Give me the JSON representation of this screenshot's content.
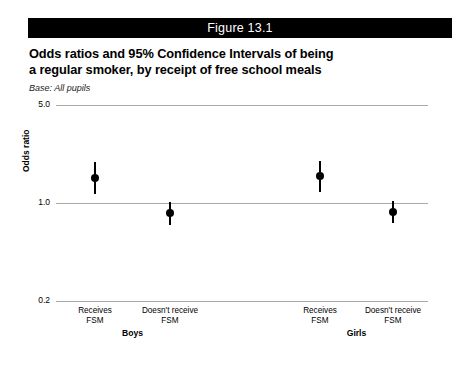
{
  "figure": {
    "bar_label": "Figure 13.1",
    "title_lines": [
      "Odds ratios and 95% Confidence Intervals of being",
      "a regular smoker, by receipt of free school meals"
    ],
    "base_note": "Base: All pupils"
  },
  "chart_data": {
    "type": "scatter",
    "title": "Odds ratios and 95% Confidence Intervals of being a regular smoker, by receipt of free school meals",
    "subtitle": "Base: All pupils",
    "xlabel": "",
    "ylabel": "Odds ratio",
    "yscale": "log",
    "ylim": [
      0.2,
      5.0
    ],
    "ytick_labels": [
      "5.0",
      "1.0",
      "0.2"
    ],
    "ytick_values": [
      5.0,
      1.0,
      0.2
    ],
    "grid": true,
    "legend": "none",
    "reference_line": 1.0,
    "groups": [
      {
        "name": "Boys",
        "categories": [
          "Receives FSM",
          "Doesn't receive FSM"
        ]
      },
      {
        "name": "Girls",
        "categories": [
          "Receives FSM",
          "Doesn't receive FSM"
        ]
      }
    ],
    "categories": [
      "Receives FSM",
      "Doesn't receive FSM",
      "Receives FSM",
      "Doesn't receive FSM"
    ],
    "points": [
      {
        "group": "Boys",
        "category": "Receives FSM",
        "category_line1": "Receives",
        "category_line2": "FSM",
        "odds_ratio": 1.5,
        "ci_lower": 1.15,
        "ci_upper": 1.95
      },
      {
        "group": "Boys",
        "category": "Doesn't receive FSM",
        "category_line1": "Doesn't receive",
        "category_line2": "FSM",
        "odds_ratio": 0.85,
        "ci_lower": 0.7,
        "ci_upper": 1.02
      },
      {
        "group": "Girls",
        "category": "Receives FSM",
        "category_line1": "Receives",
        "category_line2": "FSM",
        "odds_ratio": 1.55,
        "ci_lower": 1.2,
        "ci_upper": 2.0
      },
      {
        "group": "Girls",
        "category": "Doesn't receive FSM",
        "category_line1": "Doesn't receive",
        "category_line2": "FSM",
        "odds_ratio": 0.86,
        "ci_lower": 0.72,
        "ci_upper": 1.03
      }
    ],
    "colors": {
      "marker": "#000000",
      "gridline": "#a8a8a8",
      "header_bar": "#000000",
      "header_text": "#ffffff",
      "background": "#ffffff"
    }
  }
}
